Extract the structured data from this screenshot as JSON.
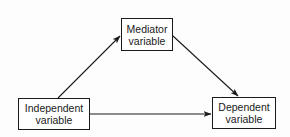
{
  "diagram": {
    "type": "mediation-model",
    "nodes": {
      "mediator": {
        "line1": "Mediator",
        "line2": "variable"
      },
      "independent": {
        "line1": "Independent",
        "line2": "variable"
      },
      "dependent": {
        "line1": "Dependent",
        "line2": "variable"
      }
    },
    "edges": [
      {
        "from": "Independent variable",
        "to": "Mediator variable"
      },
      {
        "from": "Mediator variable",
        "to": "Dependent variable"
      },
      {
        "from": "Independent variable",
        "to": "Dependent variable"
      }
    ],
    "colors": {
      "line": "#1a1a1a",
      "background": "#fdfdfd"
    }
  }
}
